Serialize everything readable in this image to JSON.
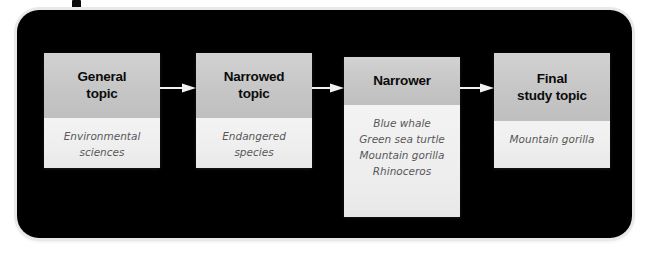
{
  "figure": {
    "panel_color": "#000000",
    "box_header_color": "#c6c6c6",
    "box_body_color": "#efefef",
    "arrow_color": "#ffffff"
  },
  "nodes": [
    {
      "id": "general-topic",
      "header": "General\ntopic",
      "header_line1": "General",
      "header_line2": "topic",
      "body_lines": [
        "Environmental",
        "sciences"
      ]
    },
    {
      "id": "narrowed-topic",
      "header": "Narrowed\ntopic",
      "header_line1": "Narrowed",
      "header_line2": "topic",
      "body_lines": [
        "Endangered",
        "species"
      ]
    },
    {
      "id": "narrower",
      "header": "Narrower",
      "header_line1": "Narrower",
      "header_line2": "",
      "body_lines": [
        "Blue whale",
        "Green sea turtle",
        "Mountain gorilla",
        "Rhinoceros"
      ]
    },
    {
      "id": "final-study-topic",
      "header": "Final\nstudy topic",
      "header_line1": "Final",
      "header_line2": "study topic",
      "body_lines": [
        "Mountain gorilla"
      ]
    }
  ],
  "arrows": [
    {
      "id": "arrow-general-to-narrowed",
      "from": "general-topic",
      "to": "narrowed-topic",
      "direction": "right"
    },
    {
      "id": "arrow-narrowed-to-narrower",
      "from": "narrowed-topic",
      "to": "narrower",
      "direction": "right"
    },
    {
      "id": "arrow-narrower-to-final",
      "from": "narrower",
      "to": "final-study-topic",
      "direction": "right"
    }
  ]
}
